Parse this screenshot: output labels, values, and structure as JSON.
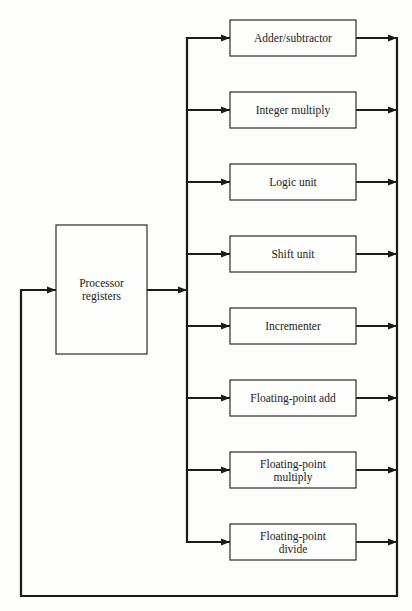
{
  "diagram": {
    "source_block": {
      "name": "processor-registers",
      "lines": [
        "Processor",
        "registers"
      ]
    },
    "functional_units": [
      {
        "name": "adder-subtractor",
        "lines": [
          "Adder/subtractor"
        ]
      },
      {
        "name": "integer-multiply",
        "lines": [
          "Integer multiply"
        ]
      },
      {
        "name": "logic-unit",
        "lines": [
          "Logic unit"
        ]
      },
      {
        "name": "shift-unit",
        "lines": [
          "Shift unit"
        ]
      },
      {
        "name": "incrementer",
        "lines": [
          "Incrementer"
        ]
      },
      {
        "name": "floating-point-add",
        "lines": [
          "Floating-point add"
        ]
      },
      {
        "name": "floating-point-multiply",
        "lines": [
          "Floating-point",
          "multiply"
        ]
      },
      {
        "name": "floating-point-divide",
        "lines": [
          "Floating-point",
          "divide"
        ]
      }
    ],
    "connections": [
      {
        "from": "processor-registers",
        "to": "input-bus"
      },
      {
        "from": "input-bus",
        "to": "each-functional-unit"
      },
      {
        "from": "each-functional-unit",
        "to": "output-bus"
      },
      {
        "from": "output-bus",
        "to": "processor-registers",
        "type": "feedback"
      }
    ],
    "colors": {
      "line": "#1a1a1a",
      "box_stroke": "#2a2a2a",
      "background": "#fdfdfb",
      "text": "#222222"
    }
  }
}
